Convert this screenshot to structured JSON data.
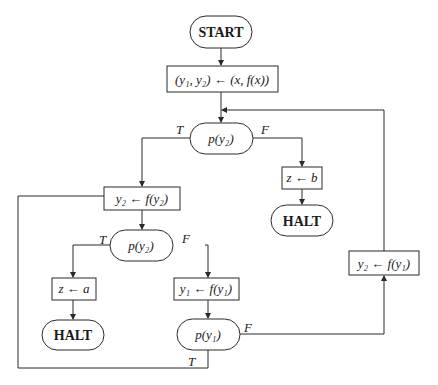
{
  "diagram": {
    "type": "flowchart",
    "nodes": {
      "start": {
        "label": "START",
        "shape": "terminal"
      },
      "init": {
        "label": "(y₁, y₂) ← (x, f(x))",
        "shape": "process"
      },
      "test_top": {
        "label": "p(y₂)",
        "shape": "decision"
      },
      "assign_zb": {
        "label": "z ← b",
        "shape": "process"
      },
      "halt_right": {
        "label": "HALT",
        "shape": "terminal"
      },
      "update_y2": {
        "label": "y₂ ← f(y₂)",
        "shape": "process"
      },
      "test_mid": {
        "label": "p(y₂)",
        "shape": "decision"
      },
      "assign_za": {
        "label": "z ← a",
        "shape": "process"
      },
      "halt_left": {
        "label": "HALT",
        "shape": "terminal"
      },
      "update_y1": {
        "label": "y₁ ← f(y₁)",
        "shape": "process"
      },
      "test_y1": {
        "label": "p(y₁)",
        "shape": "decision"
      },
      "update_y2_from_y1": {
        "label": "y₂ ← f(y₁)",
        "shape": "process"
      }
    },
    "edge_labels": {
      "top_true": "T",
      "top_false": "F",
      "mid_true": "T",
      "mid_false": "F",
      "y1_false": "F",
      "y1_true": "T"
    },
    "edges": [
      {
        "from": "start",
        "to": "init"
      },
      {
        "from": "init",
        "to": "test_top"
      },
      {
        "from": "test_top",
        "to": "update_y2",
        "label": "T"
      },
      {
        "from": "test_top",
        "to": "assign_zb",
        "label": "F"
      },
      {
        "from": "assign_zb",
        "to": "halt_right"
      },
      {
        "from": "update_y2",
        "to": "test_mid"
      },
      {
        "from": "test_mid",
        "to": "assign_za",
        "label": "T"
      },
      {
        "from": "test_mid",
        "to": "update_y1",
        "label": "F"
      },
      {
        "from": "assign_za",
        "to": "halt_left"
      },
      {
        "from": "update_y1",
        "to": "test_y1"
      },
      {
        "from": "test_y1",
        "to": "update_y2_from_y1",
        "label": "F"
      },
      {
        "from": "update_y2_from_y1",
        "to": "test_top"
      },
      {
        "from": "test_y1",
        "to": "update_y2",
        "label": "T"
      }
    ]
  }
}
